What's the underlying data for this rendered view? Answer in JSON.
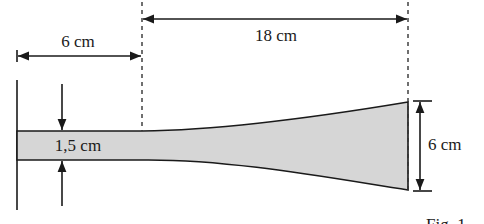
{
  "figure": {
    "caption": "Fig. 1",
    "shape_fill_color": "#d6d6d6",
    "line_color": "#1a1a1a",
    "dimensions": {
      "left_length": "6 cm",
      "tapered_length": "18 cm",
      "base_thickness": "1,5 cm",
      "end_height": "6 cm"
    }
  }
}
